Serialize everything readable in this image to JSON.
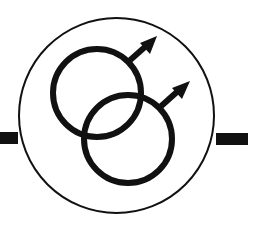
{
  "figure": {
    "description": "Two interlocking male symbols inside a circle with horizontal bars on left and right",
    "colors": {
      "background": "#ffffff",
      "ink": "#111111"
    },
    "outer_circle": {
      "cx": 116.5,
      "cy": 115.5,
      "r": 97.5,
      "stroke_width": 2
    },
    "left_bar": {
      "x": 0,
      "y": 132,
      "width": 18,
      "height": 12
    },
    "right_bar": {
      "x": 216,
      "y": 133,
      "width": 32,
      "height": 12
    },
    "symbols": [
      {
        "name": "male-symbol-upper",
        "ring": {
          "cx": 97,
          "cy": 93,
          "r": 44,
          "stroke_width": 6
        },
        "shaft": {
          "x1": 128,
          "y1": 62,
          "x2": 146,
          "y2": 46
        },
        "arrowhead": "157,36 140,43 150,54"
      },
      {
        "name": "male-symbol-lower",
        "ring": {
          "cx": 128,
          "cy": 139,
          "r": 44,
          "stroke_width": 6
        },
        "shaft": {
          "x1": 159,
          "y1": 108,
          "x2": 178,
          "y2": 91
        },
        "arrowhead": "190,81 172,88 182,99"
      }
    ]
  }
}
